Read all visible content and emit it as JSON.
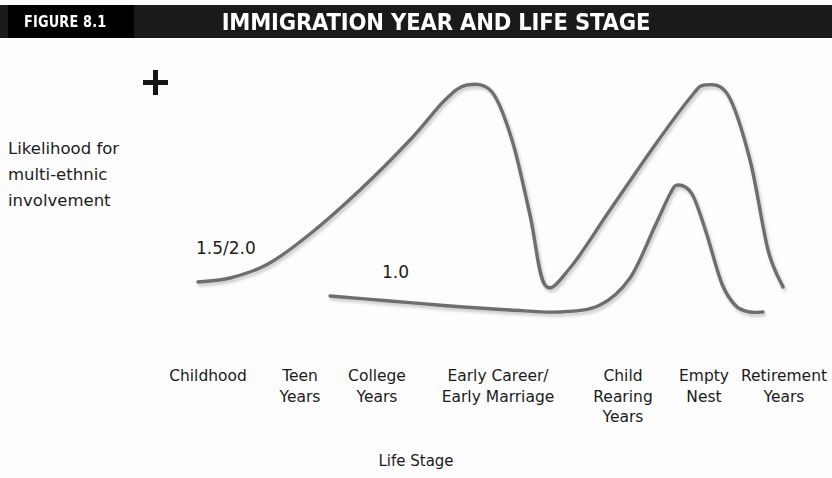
{
  "header": {
    "figure_tag": "FIGURE 8.1",
    "title": "IMMIGRATION YEAR AND LIFE STAGE",
    "bar_color": "#1a1a1a",
    "tag_color": "#000000",
    "text_color": "#ffffff"
  },
  "axes": {
    "y_label_line1": "Likelihood for",
    "y_label_line2": "multi-ethnic",
    "y_label_line3": "involvement",
    "y_top_marker": "+",
    "x_title": "Life Stage",
    "axis_color": "#4a4a4a"
  },
  "chart_data": {
    "type": "line",
    "title": "IMMIGRATION YEAR AND LIFE STAGE",
    "xlabel": "Life Stage",
    "ylabel": "Likelihood for multi-ethnic involvement",
    "grid": false,
    "legend": "inline-annotations",
    "ylim": [
      0,
      1
    ],
    "y_axis_top_marker": "+",
    "categories": [
      "Childhood",
      "Teen Years",
      "College Years",
      "Early Career/ Early Marriage",
      "Child Rearing Years",
      "Empty Nest",
      "Retirement Years"
    ],
    "category_labels": [
      {
        "line1": "Childhood",
        "line2": "",
        "line3": ""
      },
      {
        "line1": "Teen",
        "line2": "Years",
        "line3": ""
      },
      {
        "line1": "College",
        "line2": "Years",
        "line3": ""
      },
      {
        "line1": "Early Career/",
        "line2": "Early Marriage",
        "line3": ""
      },
      {
        "line1": "Child",
        "line2": "Rearing",
        "line3": "Years"
      },
      {
        "line1": "Empty",
        "line2": "Nest",
        "line3": ""
      },
      {
        "line1": "Retirement",
        "line2": "Years",
        "line3": ""
      }
    ],
    "series": [
      {
        "name": "1.5/2.0",
        "label": "1.5/2.0",
        "color": "#6e6e6e",
        "description": "Low and flat through childhood, rising steeply across college to a high peak at early career/early marriage, falling sharply to a low trough during child rearing years, rising again to an equally high peak at empty nest, then dropping to a moderate level in retirement.",
        "values": [
          0.25,
          0.3,
          0.55,
          1.0,
          0.24,
          1.0,
          0.23
        ],
        "points": [
          {
            "x": 198,
            "y": 282
          },
          {
            "x": 230,
            "y": 278
          },
          {
            "x": 268,
            "y": 264
          },
          {
            "x": 310,
            "y": 234
          },
          {
            "x": 360,
            "y": 190
          },
          {
            "x": 410,
            "y": 140
          },
          {
            "x": 445,
            "y": 100
          },
          {
            "x": 467,
            "y": 85
          },
          {
            "x": 492,
            "y": 92
          },
          {
            "x": 512,
            "y": 140
          },
          {
            "x": 530,
            "y": 215
          },
          {
            "x": 545,
            "y": 285
          },
          {
            "x": 570,
            "y": 268
          },
          {
            "x": 610,
            "y": 210
          },
          {
            "x": 655,
            "y": 145
          },
          {
            "x": 690,
            "y": 98
          },
          {
            "x": 705,
            "y": 85
          },
          {
            "x": 728,
            "y": 95
          },
          {
            "x": 750,
            "y": 160
          },
          {
            "x": 768,
            "y": 250
          },
          {
            "x": 783,
            "y": 287
          }
        ]
      },
      {
        "name": "1.0",
        "label": "1.0",
        "color": "#6e6e6e",
        "description": "Begins at college years, essentially flat with a very slight decline through child rearing years, then rises to a modest peak at empty nest that is well below the other curve, before falling back to a low level in retirement.",
        "values": [
          null,
          null,
          0.21,
          0.19,
          0.17,
          0.55,
          0.17
        ],
        "points": [
          {
            "x": 330,
            "y": 296
          },
          {
            "x": 390,
            "y": 301
          },
          {
            "x": 450,
            "y": 306
          },
          {
            "x": 510,
            "y": 310
          },
          {
            "x": 560,
            "y": 312
          },
          {
            "x": 600,
            "y": 305
          },
          {
            "x": 630,
            "y": 278
          },
          {
            "x": 655,
            "y": 226
          },
          {
            "x": 670,
            "y": 194
          },
          {
            "x": 678,
            "y": 185
          },
          {
            "x": 692,
            "y": 194
          },
          {
            "x": 706,
            "y": 232
          },
          {
            "x": 722,
            "y": 284
          },
          {
            "x": 736,
            "y": 306
          },
          {
            "x": 750,
            "y": 312
          },
          {
            "x": 763,
            "y": 312
          }
        ]
      }
    ],
    "annotations": [
      {
        "text": "1.5/2.0",
        "x": 196,
        "y": 238
      },
      {
        "text": "1.0",
        "x": 382,
        "y": 262
      }
    ]
  }
}
